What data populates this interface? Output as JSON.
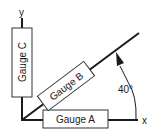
{
  "diagram": {
    "axes": {
      "x_label": "x",
      "y_label": "y"
    },
    "gauges": [
      {
        "id": "A",
        "label": "Gauge A",
        "orientation_deg": 0
      },
      {
        "id": "B",
        "label": "Gauge B",
        "orientation_deg": 40
      },
      {
        "id": "C",
        "label": "Gauge C",
        "orientation_deg": 90
      }
    ],
    "angle": {
      "label": "40°"
    },
    "colors": {
      "line": "#1a1a1a",
      "box_stroke": "#333333",
      "background": "#ffffff"
    }
  }
}
